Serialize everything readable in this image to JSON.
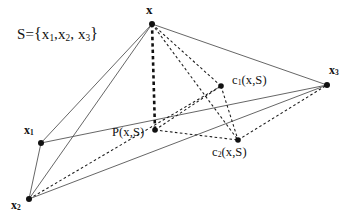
{
  "figure": {
    "width": 349,
    "height": 221,
    "background": "#ffffff",
    "ink_color": "#111111",
    "line_color": "#555555",
    "dash_color": "#1a1a1a"
  },
  "caption": {
    "set_prefix": "S={x",
    "set_s": "S",
    "eq": "=",
    "brace_open": "{",
    "brace_close": "}",
    "x_letter": "x",
    "sub1": "1",
    "sub2": "2",
    "sub3": "3",
    "comma": ",",
    "comma_space": ", ",
    "full_text": "S={x1,x2, x3}"
  },
  "points": [
    {
      "id": "x",
      "label": "x",
      "sub": "",
      "cx": 152,
      "cy": 24,
      "r": 3.0,
      "label_text": "x"
    },
    {
      "id": "x1",
      "label": "x",
      "sub": "1",
      "cx": 41,
      "cy": 143,
      "r": 3.0,
      "label_text": "x1"
    },
    {
      "id": "x2",
      "label": "x",
      "sub": "2",
      "cx": 29,
      "cy": 199,
      "r": 3.0,
      "label_text": "x2"
    },
    {
      "id": "x3",
      "label": "x",
      "sub": "3",
      "cx": 327,
      "cy": 85,
      "r": 3.0,
      "label_text": "x3"
    },
    {
      "id": "p",
      "label": "P(x,S)",
      "sub": "",
      "cx": 155,
      "cy": 130,
      "r": 2.8,
      "label_text": "P(x,S)"
    },
    {
      "id": "c1",
      "label": "c(x,S)",
      "sub": "1",
      "cx": 221,
      "cy": 86,
      "r": 2.8,
      "label_text": "c1(x,S)"
    },
    {
      "id": "c2",
      "label": "c(x,S)",
      "sub": "2",
      "cx": 238,
      "cy": 140,
      "r": 2.8,
      "label_text": "c2(x,S)"
    }
  ],
  "labels": {
    "x": {
      "text": "x"
    },
    "x1": {
      "text": "x",
      "sub": "1"
    },
    "x2": {
      "text": "x",
      "sub": "2"
    },
    "x3": {
      "text": "x",
      "sub": "3"
    },
    "p": {
      "prefix": "P(x,S)"
    },
    "c1": {
      "c": "c",
      "sub": "1",
      "arg": "(x,S)"
    },
    "c2": {
      "c": "c",
      "sub": "2",
      "arg": "(x,S)"
    }
  },
  "edges": {
    "solid": [
      {
        "name": "edge-x-x1",
        "from": "x",
        "to": "x1"
      },
      {
        "name": "edge-x-x2",
        "from": "x",
        "to": "x2"
      },
      {
        "name": "edge-x-x3",
        "from": "x",
        "to": "x3"
      },
      {
        "name": "edge-x1-x2",
        "from": "x1",
        "to": "x2"
      },
      {
        "name": "edge-x1-x3",
        "from": "x1",
        "to": "x3"
      },
      {
        "name": "edge-x2-x3",
        "from": "x2",
        "to": "x3"
      }
    ],
    "dashed_thick": [
      {
        "name": "edge-x-p",
        "from": "x",
        "to": "p"
      }
    ],
    "dashed_thin": [
      {
        "name": "edge-x-c1",
        "from": "x",
        "to": "c1"
      },
      {
        "name": "edge-x-c2",
        "from": "x",
        "to": "c2"
      },
      {
        "name": "edge-p-c1",
        "from": "p",
        "to": "c1"
      },
      {
        "name": "edge-p-c2",
        "from": "p",
        "to": "c2"
      },
      {
        "name": "edge-c1-c2",
        "from": "c1",
        "to": "c2"
      },
      {
        "name": "edge-c1-x2",
        "from": "c1",
        "to": "x2"
      },
      {
        "name": "edge-c2-x3",
        "from": "c2",
        "to": "x3"
      }
    ]
  }
}
